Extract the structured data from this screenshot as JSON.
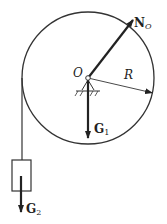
{
  "diagram": {
    "type": "pulley-free-body",
    "labels": {
      "normal_force": "N",
      "normal_force_sub": "O",
      "center": "O",
      "radius": "R",
      "weight_pulley": "G",
      "weight_pulley_sub": "1",
      "weight_block": "G",
      "weight_block_sub": "2"
    },
    "colors": {
      "stroke": "#222222",
      "background": "#ffffff"
    }
  }
}
